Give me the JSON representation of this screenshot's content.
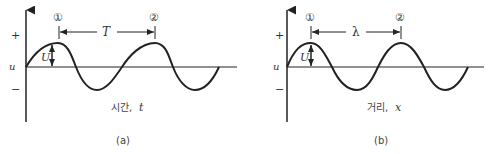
{
  "panels": [
    {
      "id": "a",
      "caption": "(a)",
      "axis_label": "시간, t",
      "axis_label_text": "시간,",
      "axis_label_var": "t",
      "interval_label": "T",
      "amplitude_label": "U",
      "marker_1": "①",
      "marker_2": "②",
      "y_plus": "+",
      "y_mid": "u",
      "y_minus": "−"
    },
    {
      "id": "b",
      "caption": "(b)",
      "axis_label": "거리, x",
      "axis_label_text": "거리,",
      "axis_label_var": "x",
      "interval_label": "λ",
      "amplitude_label": "U",
      "marker_1": "①",
      "marker_2": "②",
      "y_plus": "+",
      "y_mid": "u",
      "y_minus": "−"
    }
  ],
  "colors": {
    "stroke": "#222222",
    "text": "#333333",
    "background": "#ffffff"
  }
}
